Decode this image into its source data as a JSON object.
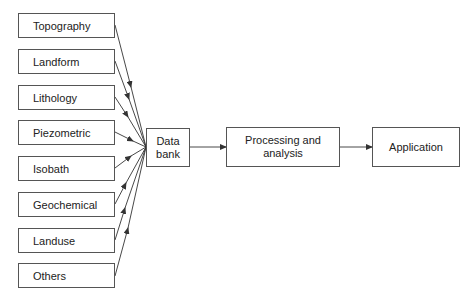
{
  "diagram": {
    "type": "flowchart",
    "sources": [
      {
        "label": "Topography"
      },
      {
        "label": "Landform"
      },
      {
        "label": "Lithology"
      },
      {
        "label": "Piezometric"
      },
      {
        "label": "Isobath"
      },
      {
        "label": "Geochemical"
      },
      {
        "label": "Landuse"
      },
      {
        "label": "Others"
      }
    ],
    "data_bank": {
      "line1": "Data",
      "line2": "bank"
    },
    "processing": {
      "line1": "Processing and",
      "line2": "analysis"
    },
    "application": {
      "label": "Application"
    },
    "line_color": "#333333",
    "box_border_color": "#555555"
  }
}
